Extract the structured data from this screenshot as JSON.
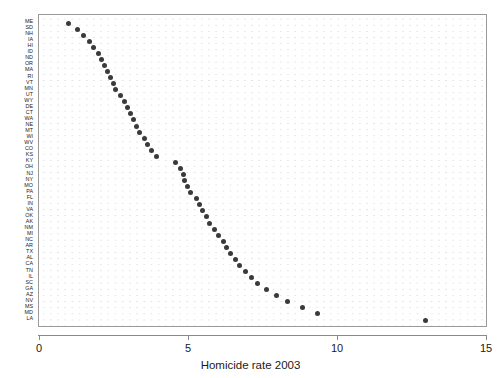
{
  "chart_data": {
    "type": "scatter",
    "title": "",
    "subtitle": "",
    "xlabel": "Homicide rate 2003",
    "ylabel": "",
    "xlim": [
      0,
      15
    ],
    "xticks": [
      0,
      5,
      10,
      15
    ],
    "xticklabels": [
      "0",
      "5",
      "10",
      "15"
    ],
    "grid": true,
    "grid_style": "dotted",
    "legend": null,
    "orientation": "horizontal-dotplot",
    "sort": "ascending-by-value",
    "marker": {
      "shape": "circle",
      "color": "#3a3a3a",
      "size": 5
    },
    "categories": [
      "ME",
      "SD",
      "NH",
      "IA",
      "HI",
      "ID",
      "ND",
      "OR",
      "MA",
      "RI",
      "VT",
      "MN",
      "UT",
      "WY",
      "DE",
      "CT",
      "WA",
      "NE",
      "MT",
      "WI",
      "WV",
      "CO",
      "KS",
      "KY",
      "OH",
      "NJ",
      "NY",
      "MO",
      "PA",
      "FL",
      "IN",
      "VA",
      "OK",
      "AK",
      "NM",
      "MI",
      "NC",
      "AR",
      "TX",
      "AL",
      "CA",
      "TN",
      "IL",
      "SC",
      "GA",
      "AZ",
      "NV",
      "MS",
      "MD",
      "LA"
    ],
    "values": [
      0.95,
      1.25,
      1.45,
      1.65,
      1.8,
      1.95,
      2.05,
      2.15,
      2.25,
      2.35,
      2.45,
      2.55,
      2.7,
      2.85,
      2.95,
      3.05,
      3.15,
      3.25,
      3.35,
      3.5,
      3.6,
      3.75,
      3.9,
      4.55,
      4.7,
      4.8,
      4.85,
      4.95,
      5.05,
      5.25,
      5.35,
      5.45,
      5.6,
      5.7,
      5.85,
      6.0,
      6.15,
      6.25,
      6.4,
      6.55,
      6.7,
      6.9,
      7.1,
      7.3,
      7.6,
      7.95,
      8.3,
      8.8,
      9.3,
      12.95
    ],
    "x_unit_label": "per 100,000 population"
  },
  "axis": {
    "x_title": "Homicide rate 2003"
  }
}
